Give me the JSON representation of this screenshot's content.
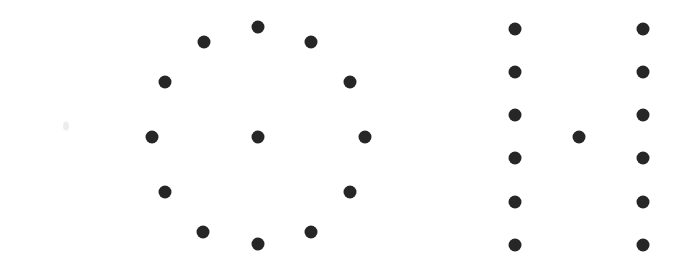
{
  "figure": {
    "canvas": {
      "width": 693,
      "height": 265,
      "background": "#ffffff"
    },
    "dot_color": "#262626",
    "dot_diameter": 13,
    "faint_mark_color": "#ededed"
  },
  "chart_data": {
    "type": "scatter",
    "subtitle": "",
    "xlabel": "",
    "ylabel": "",
    "xlim": [
      0,
      693
    ],
    "ylim": [
      265,
      0
    ],
    "grid": false,
    "legend": "none",
    "axis_visible": false,
    "tick_labels_x": [],
    "tick_labels_y": [],
    "annotations": [],
    "marker": {
      "shape": "circle",
      "size_px": 13,
      "color": "#262626"
    },
    "series": [
      {
        "name": "left-ring-perimeter",
        "description": "Twelve dots arranged in a circular ring, clock-face style",
        "count": 12,
        "points": [
          {
            "x": 258,
            "y": 27
          },
          {
            "x": 311,
            "y": 42
          },
          {
            "x": 350,
            "y": 82
          },
          {
            "x": 365,
            "y": 137
          },
          {
            "x": 350,
            "y": 192
          },
          {
            "x": 311,
            "y": 232
          },
          {
            "x": 258,
            "y": 244
          },
          {
            "x": 203,
            "y": 232
          },
          {
            "x": 165,
            "y": 192
          },
          {
            "x": 152,
            "y": 137
          },
          {
            "x": 165,
            "y": 82
          },
          {
            "x": 204,
            "y": 42
          }
        ]
      },
      {
        "name": "left-ring-center",
        "description": "Single dot at the centre of the left ring",
        "count": 1,
        "points": [
          {
            "x": 258,
            "y": 137
          }
        ]
      },
      {
        "name": "right-left-column",
        "description": "Vertical column of six evenly spaced dots",
        "count": 6,
        "points": [
          {
            "x": 515,
            "y": 29
          },
          {
            "x": 515,
            "y": 72
          },
          {
            "x": 515,
            "y": 115
          },
          {
            "x": 515,
            "y": 158
          },
          {
            "x": 515,
            "y": 202
          },
          {
            "x": 515,
            "y": 245
          }
        ]
      },
      {
        "name": "right-right-column",
        "description": "Vertical column of six evenly spaced dots",
        "count": 6,
        "points": [
          {
            "x": 643,
            "y": 29
          },
          {
            "x": 643,
            "y": 72
          },
          {
            "x": 643,
            "y": 115
          },
          {
            "x": 643,
            "y": 158
          },
          {
            "x": 643,
            "y": 202
          },
          {
            "x": 643,
            "y": 245
          }
        ]
      },
      {
        "name": "right-middle-dot",
        "description": "Single dot between the two right-hand columns",
        "count": 1,
        "points": [
          {
            "x": 579,
            "y": 137
          }
        ]
      }
    ],
    "faint_marks": [
      {
        "name": "faint-speck",
        "x": 66,
        "y": 126,
        "width": 6,
        "height": 9
      }
    ],
    "total_dots": 26
  }
}
